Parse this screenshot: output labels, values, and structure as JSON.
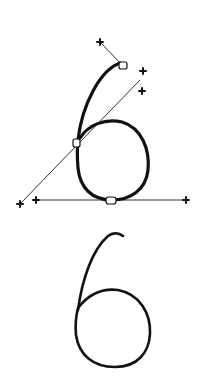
{
  "diagram": {
    "colors": {
      "stroke": "#111111",
      "guide": "#333333",
      "background": "#ffffff"
    },
    "upper": {
      "label": "digit-6-with-control-points",
      "anchors": [
        {
          "name": "top-anchor",
          "x": 123,
          "y": 66
        },
        {
          "name": "mid-anchor",
          "x": 77,
          "y": 143
        },
        {
          "name": "bottom-anchor",
          "x": 111,
          "y": 200
        }
      ],
      "handles": [
        {
          "name": "top-handle",
          "x": 100,
          "y": 42
        },
        {
          "name": "diag-handle-upper",
          "x": 143,
          "y": 71
        },
        {
          "name": "diag-handle-lower",
          "x": 142,
          "y": 91
        },
        {
          "name": "diag-handle-bottom-left",
          "x": 20,
          "y": 204
        },
        {
          "name": "horiz-handle-left",
          "x": 36,
          "y": 200
        },
        {
          "name": "horiz-handle-right",
          "x": 186,
          "y": 200
        }
      ]
    },
    "lower": {
      "label": "rendered-digit-6"
    }
  }
}
